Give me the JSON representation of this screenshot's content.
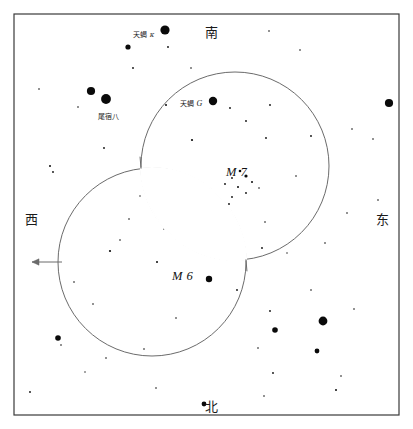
{
  "chart_data": {
    "type": "scatter",
    "title": "",
    "xlabel": "",
    "ylabel": "",
    "grid": false,
    "legend_position": "none",
    "xlim": [
      0,
      413
    ],
    "ylim": [
      0,
      429
    ],
    "frame": {
      "x": 14,
      "y": 14,
      "width": 385,
      "height": 401,
      "stroke": "#3a3a3a"
    },
    "circles": [
      {
        "name": "M7",
        "cx": 235,
        "cy": 166,
        "r": 94,
        "stroke": "#6b6b6b"
      },
      {
        "name": "M6",
        "cx": 152,
        "cy": 262,
        "r": 94,
        "stroke": "#6b6b6b"
      }
    ],
    "arrow": {
      "name": "west-pointer",
      "x1": 62,
      "y1": 262,
      "x2": 32,
      "y2": 262,
      "stroke": "#6b6b6b"
    },
    "direction_labels": [
      {
        "text": "南",
        "x": 205,
        "y": 26,
        "position": "top"
      },
      {
        "text": "东",
        "x": 376,
        "y": 213,
        "position": "right"
      },
      {
        "text": "北",
        "x": 205,
        "y": 400,
        "position": "bottom"
      },
      {
        "text": "西",
        "x": 25,
        "y": 213,
        "position": "left"
      }
    ],
    "object_labels": [
      {
        "text": "M 7",
        "x": 226,
        "y": 166
      },
      {
        "text": "M 6",
        "x": 172,
        "y": 270
      }
    ],
    "star_labels": [
      {
        "han": "天蝎",
        "greek": "κ",
        "x": 133,
        "y": 32
      },
      {
        "han": "尾宿八",
        "greek": "",
        "x": 98,
        "y": 114
      },
      {
        "han": "天蝎",
        "greek": "G",
        "x": 180,
        "y": 100
      }
    ],
    "stars": [
      {
        "x": 165,
        "y": 30,
        "r": 4.6
      },
      {
        "x": 128,
        "y": 47,
        "r": 2.6
      },
      {
        "x": 91,
        "y": 91,
        "r": 4.1
      },
      {
        "x": 106,
        "y": 99,
        "r": 4.9
      },
      {
        "x": 213,
        "y": 101,
        "r": 4.2
      },
      {
        "x": 389,
        "y": 103,
        "r": 4.1
      },
      {
        "x": 209,
        "y": 279,
        "r": 3.2
      },
      {
        "x": 323,
        "y": 321,
        "r": 4.4
      },
      {
        "x": 275,
        "y": 330,
        "r": 2.8
      },
      {
        "x": 58,
        "y": 338,
        "r": 2.8
      },
      {
        "x": 317,
        "y": 351,
        "r": 2.4
      },
      {
        "x": 204,
        "y": 404,
        "r": 2.4
      },
      {
        "x": 168,
        "y": 47,
        "r": 0.9
      },
      {
        "x": 133,
        "y": 68,
        "r": 0.9
      },
      {
        "x": 191,
        "y": 68,
        "r": 0.8
      },
      {
        "x": 269,
        "y": 31,
        "r": 0.8
      },
      {
        "x": 300,
        "y": 50,
        "r": 0.8
      },
      {
        "x": 39,
        "y": 89,
        "r": 0.8
      },
      {
        "x": 78,
        "y": 107,
        "r": 0.8
      },
      {
        "x": 166,
        "y": 105,
        "r": 1.0
      },
      {
        "x": 270,
        "y": 105,
        "r": 0.9
      },
      {
        "x": 230,
        "y": 108,
        "r": 0.9
      },
      {
        "x": 246,
        "y": 121,
        "r": 0.9
      },
      {
        "x": 311,
        "y": 136,
        "r": 0.9
      },
      {
        "x": 266,
        "y": 138,
        "r": 0.9
      },
      {
        "x": 192,
        "y": 140,
        "r": 1.1
      },
      {
        "x": 352,
        "y": 129,
        "r": 0.8
      },
      {
        "x": 373,
        "y": 139,
        "r": 0.8
      },
      {
        "x": 104,
        "y": 148,
        "r": 0.9
      },
      {
        "x": 50,
        "y": 166,
        "r": 1.0
      },
      {
        "x": 53,
        "y": 172,
        "r": 0.9
      },
      {
        "x": 240,
        "y": 171,
        "r": 1.3
      },
      {
        "x": 246,
        "y": 176,
        "r": 1.6
      },
      {
        "x": 232,
        "y": 178,
        "r": 0.9
      },
      {
        "x": 252,
        "y": 182,
        "r": 1.0
      },
      {
        "x": 238,
        "y": 187,
        "r": 1.0
      },
      {
        "x": 225,
        "y": 184,
        "r": 0.9
      },
      {
        "x": 246,
        "y": 193,
        "r": 0.9
      },
      {
        "x": 232,
        "y": 197,
        "r": 0.9
      },
      {
        "x": 259,
        "y": 188,
        "r": 0.8
      },
      {
        "x": 229,
        "y": 204,
        "r": 0.9
      },
      {
        "x": 157,
        "y": 174,
        "r": 0.8
      },
      {
        "x": 296,
        "y": 176,
        "r": 0.8
      },
      {
        "x": 347,
        "y": 213,
        "r": 0.8
      },
      {
        "x": 378,
        "y": 200,
        "r": 0.8
      },
      {
        "x": 129,
        "y": 219,
        "r": 0.8
      },
      {
        "x": 164,
        "y": 229,
        "r": 0.8
      },
      {
        "x": 265,
        "y": 222,
        "r": 0.8
      },
      {
        "x": 120,
        "y": 240,
        "r": 0.8
      },
      {
        "x": 110,
        "y": 251,
        "r": 1.1
      },
      {
        "x": 157,
        "y": 262,
        "r": 1.0
      },
      {
        "x": 262,
        "y": 248,
        "r": 0.9
      },
      {
        "x": 74,
        "y": 282,
        "r": 0.8
      },
      {
        "x": 237,
        "y": 290,
        "r": 0.9
      },
      {
        "x": 311,
        "y": 290,
        "r": 0.8
      },
      {
        "x": 93,
        "y": 304,
        "r": 0.8
      },
      {
        "x": 176,
        "y": 318,
        "r": 0.8
      },
      {
        "x": 270,
        "y": 311,
        "r": 0.9
      },
      {
        "x": 354,
        "y": 309,
        "r": 0.8
      },
      {
        "x": 61,
        "y": 345,
        "r": 0.8
      },
      {
        "x": 144,
        "y": 349,
        "r": 0.8
      },
      {
        "x": 258,
        "y": 348,
        "r": 0.8
      },
      {
        "x": 106,
        "y": 358,
        "r": 0.8
      },
      {
        "x": 273,
        "y": 373,
        "r": 0.9
      },
      {
        "x": 30,
        "y": 392,
        "r": 0.9
      },
      {
        "x": 341,
        "y": 376,
        "r": 0.8
      },
      {
        "x": 264,
        "y": 396,
        "r": 0.8
      },
      {
        "x": 336,
        "y": 390,
        "r": 1.0
      },
      {
        "x": 156,
        "y": 388,
        "r": 0.8
      },
      {
        "x": 85,
        "y": 372,
        "r": 0.7
      },
      {
        "x": 325,
        "y": 243,
        "r": 0.8
      },
      {
        "x": 287,
        "y": 253,
        "r": 0.7
      },
      {
        "x": 197,
        "y": 245,
        "r": 0.7
      },
      {
        "x": 140,
        "y": 196,
        "r": 0.7
      },
      {
        "x": 210,
        "y": 228,
        "r": 0.7
      }
    ]
  }
}
